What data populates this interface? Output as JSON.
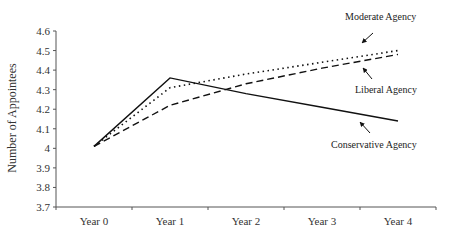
{
  "chart_data": {
    "type": "line",
    "title": "",
    "xlabel": "",
    "ylabel": "Number of Appointees",
    "categories": [
      "Year 0",
      "Year 1",
      "Year 2",
      "Year 3",
      "Year 4"
    ],
    "ylim": [
      3.7,
      4.6
    ],
    "yticks": [
      "3.7",
      "3.8",
      "3.9",
      "4",
      "4.1",
      "4.2",
      "4.3",
      "4.4",
      "4.5",
      "4.6"
    ],
    "grid": false,
    "legend": "none (inline annotations with arrows)",
    "series": [
      {
        "name": "Moderate Agency",
        "style": "dotted",
        "values": [
          4.01,
          4.31,
          4.38,
          4.44,
          4.5
        ]
      },
      {
        "name": "Liberal Agency",
        "style": "dashed",
        "values": [
          4.01,
          4.22,
          4.33,
          4.41,
          4.48
        ]
      },
      {
        "name": "Conservative Agency",
        "style": "solid",
        "values": [
          4.01,
          4.36,
          4.28,
          4.21,
          4.14
        ]
      }
    ],
    "annotations": [
      {
        "text": "Moderate Agency",
        "series": "Moderate Agency"
      },
      {
        "text": "Liberal Agency",
        "series": "Liberal Agency"
      },
      {
        "text": "Conservative Agency",
        "series": "Conservative Agency"
      }
    ]
  },
  "colors": {
    "line": "#111111",
    "axis": "#555555",
    "text": "#333333"
  }
}
